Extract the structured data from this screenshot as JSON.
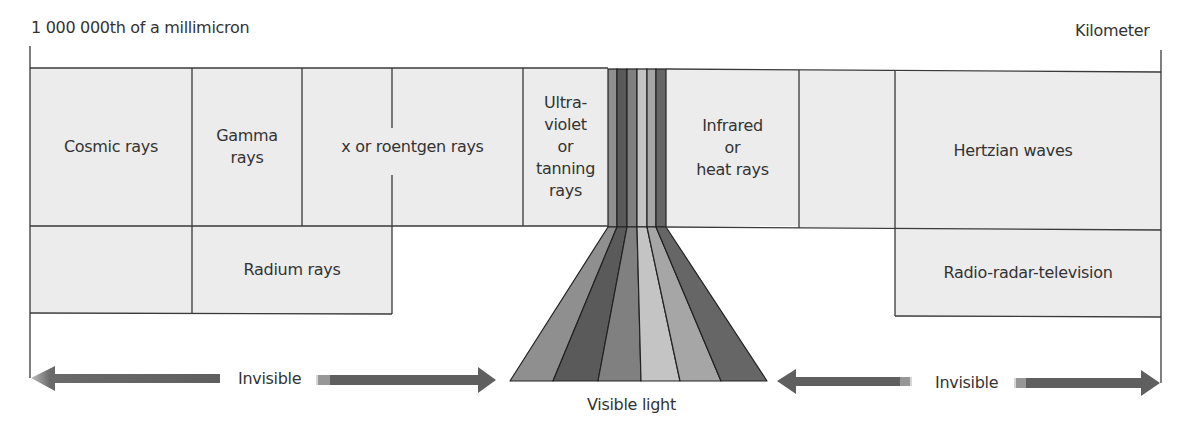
{
  "scale": {
    "left_label": "1 000 000th of a millimicron",
    "right_label": "Kilometer"
  },
  "top_row": [
    {
      "label": "Cosmic rays"
    },
    {
      "label": "Gamma\nrays"
    },
    {
      "label": "x or roentgen rays"
    },
    {
      "label": "Ultra-\nviolet\nor\ntanning\nrays"
    },
    {
      "label": "Infrared\nor\nheat rays"
    },
    {
      "label": ""
    },
    {
      "label": "Hertzian waves"
    }
  ],
  "bottom_row": [
    {
      "label": ""
    },
    {
      "label": "Radium rays"
    },
    {
      "label": "Radio-radar-television"
    }
  ],
  "visible_spectrum": {
    "label": "Visible light",
    "band_colors": [
      "#8f8f8f",
      "#5a5a5a",
      "#808080",
      "#c4c4c4",
      "#a6a6a6",
      "#666666"
    ]
  },
  "arrows": {
    "left_label": "Invisible",
    "right_label": "Invisible",
    "color": "#5f5f5f"
  },
  "colors": {
    "cell_fill": "#ececec",
    "line": "#3a3a3a"
  }
}
